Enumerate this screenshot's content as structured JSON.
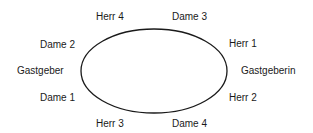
{
  "diagram": {
    "type": "seating-plan",
    "table_shape": "ellipse",
    "seats": {
      "top_left": "Herr 4",
      "top_right": "Dame 3",
      "upper_left": "Dame 2",
      "upper_right": "Herr 1",
      "left": "Gastgeber",
      "right": "Gastgeberin",
      "lower_left": "Dame 1",
      "lower_right": "Herr 2",
      "bottom_left": "Herr 3",
      "bottom_right": "Dame 4"
    }
  }
}
